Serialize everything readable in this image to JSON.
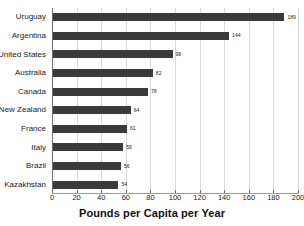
{
  "chart_data": {
    "type": "bar",
    "orientation": "horizontal",
    "title": "",
    "xlabel": "Pounds per Capita per Year",
    "ylabel": "",
    "xlim": [
      0,
      200
    ],
    "ylim": null,
    "grid": true,
    "legend": null,
    "bar_color": "#3a3a3a",
    "xticks": [
      0,
      20,
      40,
      60,
      80,
      100,
      120,
      140,
      160,
      180,
      200
    ],
    "xticklabels": [
      "0",
      "20",
      "40",
      "60",
      "80",
      "100",
      "120",
      "140",
      "160",
      "180",
      "200"
    ],
    "categories": [
      "Uruguay",
      "Argentina",
      "United States",
      "Australia",
      "Canada",
      "New Zealand",
      "France",
      "Italy",
      "Brazil",
      "Kazakhstan"
    ],
    "values": [
      189,
      144,
      98,
      82,
      78,
      64,
      61,
      58,
      56,
      54
    ],
    "data_labels": [
      "189",
      "144",
      "98",
      "82",
      "78",
      "64",
      "61",
      "58",
      "56",
      "54"
    ]
  }
}
